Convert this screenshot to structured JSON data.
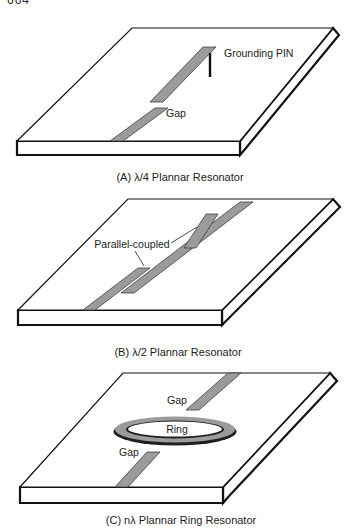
{
  "page_number": "664",
  "colors": {
    "paper": "#ffffff",
    "ink": "#1c1c1c",
    "strip_fill": "#9b9b9b",
    "strip_edge": "#3f3f3f",
    "slab_face": "#ffffff",
    "slab_edge": "#111111"
  },
  "figures": {
    "a": {
      "caption": "(A) λ/4 Plannar Resonator",
      "labels": {
        "grounding_pin": "Grounding PIN",
        "gap": "Gap"
      }
    },
    "b": {
      "caption": "(B) λ/2 Plannar Resonator",
      "labels": {
        "parallel_coupled": "Parallel-coupled"
      }
    },
    "c": {
      "caption": "(C) nλ Plannar Ring Resonator",
      "labels": {
        "gap_top": "Gap",
        "ring": "Ring",
        "gap_bottom": "Gap"
      }
    }
  }
}
